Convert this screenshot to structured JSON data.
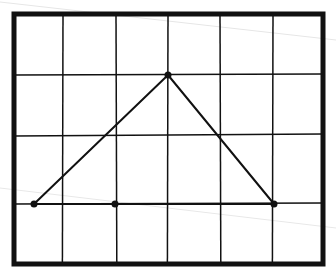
{
  "diagram": {
    "title": "Hand-drawn triangle on grid",
    "background": "#ffffff",
    "ink": "#111111",
    "frame": {
      "x1": 14,
      "y1": 14,
      "x2": 323,
      "y2": 264,
      "stroke_width": 5
    },
    "grid": {
      "vertical_x": [
        63,
        116,
        168,
        220,
        273
      ],
      "horizontal_y": [
        75,
        135,
        204
      ],
      "stroke_width": 1.5
    },
    "points": [
      {
        "id": "A",
        "x": 34,
        "y": 204
      },
      {
        "id": "B",
        "x": 115,
        "y": 204
      },
      {
        "id": "C",
        "x": 168,
        "y": 75
      },
      {
        "id": "D",
        "x": 274,
        "y": 204
      }
    ],
    "segments": [
      {
        "from": "A",
        "to": "C"
      },
      {
        "from": "C",
        "to": "D"
      },
      {
        "from": "A",
        "to": "D"
      }
    ],
    "point_radius": 3.5
  }
}
